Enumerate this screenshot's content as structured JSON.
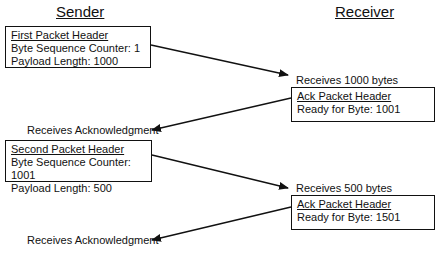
{
  "titles": {
    "sender": "Sender",
    "receiver": "Receiver"
  },
  "sender_packets": [
    {
      "header": "First Packet Header",
      "line1": "Byte Sequence Counter: 1",
      "line2": "Payload Length: 1000"
    },
    {
      "header": "Second Packet Header",
      "line1": "Byte Sequence Counter: 1001",
      "line2": "Payload Length: 500"
    }
  ],
  "receiver_acks": [
    {
      "received": "Receives 1000 bytes",
      "header": "Ack Packet Header",
      "line1": "Ready for Byte: 1001"
    },
    {
      "received": "Receives 500 bytes",
      "header": "Ack Packet Header",
      "line1": "Ready for Byte: 1501"
    }
  ],
  "sender_events": [
    "Receives Acknowledgment",
    "Receives Acknowledgment"
  ],
  "colors": {
    "line": "#111111",
    "background": "#ffffff"
  }
}
